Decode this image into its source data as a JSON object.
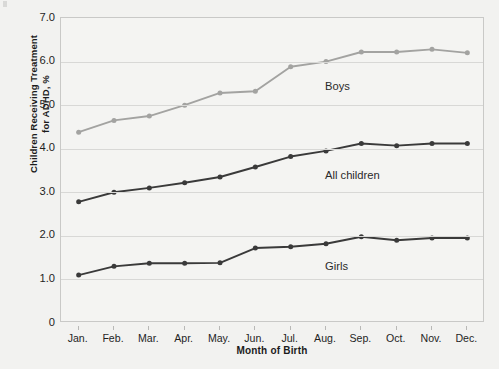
{
  "chart_data": {
    "type": "line",
    "title": "",
    "xlabel": "Month of Birth",
    "ylabel": "Children Receiving Treatment\nfor ADHD, %",
    "categories": [
      "Jan.",
      "Feb.",
      "Mar.",
      "Apr.",
      "May.",
      "Jun.",
      "Jul.",
      "Aug.",
      "Sep.",
      "Oct.",
      "Nov.",
      "Dec."
    ],
    "ylim": [
      0,
      7.0
    ],
    "yticks": [
      0,
      1.0,
      2.0,
      3.0,
      4.0,
      5.0,
      6.0,
      7.0
    ],
    "ytick_labels": [
      "0",
      "1.0",
      "2.0",
      "3.0",
      "4.0",
      "5.0",
      "6.0",
      "7.0"
    ],
    "grid": true,
    "legend_position": "inline-labels",
    "series": [
      {
        "name": "Boys",
        "color": "#a3a3a1",
        "values": [
          4.38,
          4.65,
          4.75,
          5.0,
          5.28,
          5.32,
          5.88,
          6.0,
          6.22,
          6.22,
          6.28,
          6.2
        ],
        "label_x_index": 7,
        "label_value": 5.55
      },
      {
        "name": "All children",
        "color": "#3a3a3a",
        "values": [
          2.78,
          3.0,
          3.1,
          3.22,
          3.35,
          3.58,
          3.82,
          3.95,
          4.12,
          4.07,
          4.12,
          4.12
        ],
        "label_x_index": 7,
        "label_value": 3.52
      },
      {
        "name": "Girls",
        "color": "#3a3a3a",
        "values": [
          1.1,
          1.3,
          1.37,
          1.37,
          1.38,
          1.72,
          1.75,
          1.82,
          1.98,
          1.9,
          1.95,
          1.95
        ],
        "label_x_index": 7,
        "label_value": 1.42
      }
    ]
  },
  "colors": {
    "background": "#f2f2f0",
    "plot_background": "#f4f4f2",
    "gridline": "#d8d8d6",
    "frame": "#c9c9c7",
    "boys_series": "#a3a3a1",
    "dark_series": "#3a3a3a",
    "text": "#1f1f1f"
  }
}
